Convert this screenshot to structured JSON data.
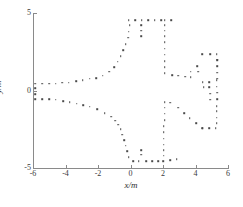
{
  "chart_data": {
    "type": "scatter",
    "title": "",
    "xlabel": "x/m",
    "ylabel": "y/m",
    "xlim": [
      -6,
      6
    ],
    "ylim": [
      -5,
      5
    ],
    "xticks": [
      -6,
      -4,
      -2,
      0,
      2,
      4,
      6
    ],
    "xticklabels": [
      "-6",
      "-4",
      "-2",
      "0",
      "2",
      "4",
      "6"
    ],
    "yticks": [
      -5,
      0,
      5
    ],
    "yticklabels": [
      "-5",
      "0",
      "5"
    ],
    "grid": false,
    "legend": null,
    "marker": "dot",
    "marker_color": "#4a4a4a",
    "axis_color": "#8a8a8a",
    "points": [
      [
        -5.85,
        0.45
      ],
      [
        -5.85,
        0.15
      ],
      [
        -5.85,
        -0.25
      ],
      [
        -5.85,
        -0.55
      ],
      [
        -5.45,
        0.45
      ],
      [
        -5.45,
        -0.55
      ],
      [
        -5.0,
        0.45
      ],
      [
        -5.0,
        -0.55
      ],
      [
        -4.6,
        0.45
      ],
      [
        -4.6,
        -0.6
      ],
      [
        -4.2,
        0.5
      ],
      [
        -4.15,
        -0.7
      ],
      [
        -3.8,
        0.5
      ],
      [
        -3.75,
        -0.75
      ],
      [
        -3.35,
        0.6
      ],
      [
        -3.3,
        -0.85
      ],
      [
        -2.95,
        0.65
      ],
      [
        -2.9,
        -0.95
      ],
      [
        -2.5,
        0.75
      ],
      [
        -2.5,
        -1.05
      ],
      [
        -2.1,
        0.8
      ],
      [
        -2.05,
        -1.2
      ],
      [
        -1.7,
        0.95
      ],
      [
        -1.6,
        -1.45
      ],
      [
        -1.3,
        1.2
      ],
      [
        -1.2,
        -1.7
      ],
      [
        -1.0,
        1.5
      ],
      [
        -0.95,
        -1.95
      ],
      [
        -0.8,
        1.85
      ],
      [
        -0.75,
        -2.2
      ],
      [
        -0.6,
        2.2
      ],
      [
        -0.6,
        -2.5
      ],
      [
        -0.45,
        2.6
      ],
      [
        -0.5,
        -2.85
      ],
      [
        -0.3,
        3.0
      ],
      [
        -0.4,
        -3.2
      ],
      [
        -0.15,
        3.4
      ],
      [
        -0.3,
        -3.55
      ],
      [
        -0.1,
        3.8
      ],
      [
        -0.2,
        -3.9
      ],
      [
        -0.05,
        4.2
      ],
      [
        -0.1,
        -4.3
      ],
      [
        -0.1,
        4.55
      ],
      [
        0.15,
        -4.55
      ],
      [
        0.3,
        4.55
      ],
      [
        0.5,
        -4.55
      ],
      [
        0.7,
        4.55
      ],
      [
        0.65,
        -4.15
      ],
      [
        0.65,
        4.2
      ],
      [
        0.65,
        -3.85
      ],
      [
        0.65,
        3.85
      ],
      [
        0.95,
        -4.55
      ],
      [
        0.65,
        3.5
      ],
      [
        1.35,
        -4.55
      ],
      [
        1.1,
        4.55
      ],
      [
        1.7,
        -4.55
      ],
      [
        1.5,
        4.55
      ],
      [
        2.0,
        -4.55
      ],
      [
        1.9,
        4.55
      ],
      [
        2.05,
        -4.2
      ],
      [
        2.1,
        4.55
      ],
      [
        2.05,
        -3.85
      ],
      [
        2.1,
        4.2
      ],
      [
        2.05,
        -3.5
      ],
      [
        2.1,
        3.85
      ],
      [
        2.05,
        -3.1
      ],
      [
        2.1,
        3.5
      ],
      [
        2.05,
        -2.7
      ],
      [
        2.1,
        3.1
      ],
      [
        2.05,
        -2.3
      ],
      [
        2.1,
        2.7
      ],
      [
        2.1,
        -1.9
      ],
      [
        2.1,
        2.3
      ],
      [
        2.1,
        -1.5
      ],
      [
        2.1,
        1.9
      ],
      [
        2.1,
        -1.1
      ],
      [
        2.1,
        1.5
      ],
      [
        2.1,
        -0.75
      ],
      [
        2.1,
        1.1
      ],
      [
        2.45,
        -0.8
      ],
      [
        2.5,
        4.55
      ],
      [
        2.45,
        -4.5
      ],
      [
        2.55,
        1.0
      ],
      [
        2.85,
        -4.45
      ],
      [
        2.95,
        0.95
      ],
      [
        2.95,
        -1.1
      ],
      [
        3.35,
        0.9
      ],
      [
        3.3,
        -1.45
      ],
      [
        3.7,
        1.2
      ],
      [
        3.65,
        -1.8
      ],
      [
        3.7,
        0.85
      ],
      [
        4.05,
        -2.1
      ],
      [
        4.1,
        1.55
      ],
      [
        4.4,
        -2.45
      ],
      [
        4.15,
        1.2
      ],
      [
        4.45,
        -2.45
      ],
      [
        4.4,
        2.35
      ],
      [
        4.85,
        -2.45
      ],
      [
        4.45,
        0.55
      ],
      [
        5.25,
        -2.45
      ],
      [
        4.5,
        0.2
      ],
      [
        5.3,
        -2.1
      ],
      [
        4.9,
        2.35
      ],
      [
        5.3,
        -1.75
      ],
      [
        4.85,
        0.55
      ],
      [
        5.3,
        -1.35
      ],
      [
        4.85,
        0.2
      ],
      [
        5.3,
        -1.0
      ],
      [
        4.9,
        -0.2
      ],
      [
        5.35,
        -0.55
      ],
      [
        5.3,
        2.35
      ],
      [
        5.35,
        -0.15
      ],
      [
        5.35,
        1.95
      ],
      [
        4.9,
        -0.6
      ],
      [
        5.35,
        1.55
      ],
      [
        5.3,
        0.25
      ],
      [
        5.35,
        1.15
      ],
      [
        5.3,
        0.65
      ],
      [
        5.35,
        0.75
      ],
      [
        5.35,
        2.0
      ]
    ]
  },
  "caption": {
    "text": ""
  }
}
